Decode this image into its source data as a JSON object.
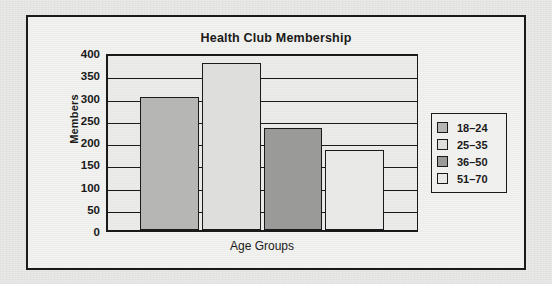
{
  "chart_data": {
    "type": "bar",
    "title": "Health Club Membership",
    "xlabel": "Age Groups",
    "ylabel": "Members",
    "categories": [
      "18–24",
      "25–35",
      "36–50",
      "51–70"
    ],
    "values": [
      300,
      375,
      230,
      180
    ],
    "ylim": [
      0,
      400
    ],
    "ytick_step": 50,
    "yticks": [
      "400",
      "350",
      "300",
      "250",
      "200",
      "150",
      "100",
      "50",
      "0"
    ],
    "ytick_values": [
      400,
      350,
      300,
      250,
      200,
      150,
      100,
      50,
      0
    ],
    "grid": true,
    "grid_axis": "y",
    "legend_position": "right",
    "legend": [
      {
        "label": "18–24",
        "color": "#b6b6b4"
      },
      {
        "label": "25–35",
        "color": "#dededc"
      },
      {
        "label": "36–50",
        "color": "#9a9a98"
      },
      {
        "label": "51–70",
        "color": "#e9e9e7"
      }
    ],
    "series": [
      {
        "name": "Members",
        "values": [
          300,
          375,
          230,
          180
        ]
      }
    ]
  },
  "colors": {
    "ink": "#1a1a1a",
    "plot_background": "#ececeb",
    "figure_background": "#f2f2f0",
    "page_background": "#e9e9e7"
  }
}
